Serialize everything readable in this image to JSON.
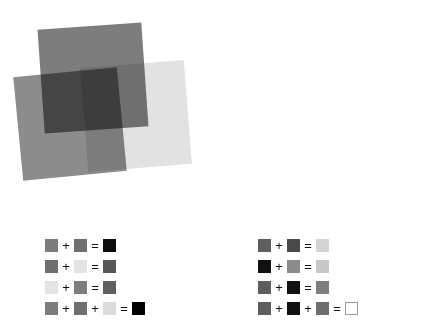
{
  "figure": {
    "background_color": "#ffffff",
    "panels": [
      {
        "name": "multiply-panel",
        "blend_mode": "multiply",
        "squares": [
          {
            "name": "square-top",
            "color": "#7d7d7d",
            "rotation_deg": -4.0
          },
          {
            "name": "square-bottom-left",
            "color": "#8c8c8c",
            "rotation_deg": -5.5
          },
          {
            "name": "square-bottom-right",
            "color": "#e2e2e2",
            "rotation_deg": -4.5
          }
        ]
      },
      {
        "name": "screen-panel",
        "blend_mode": "screen",
        "squares": [
          {
            "name": "square-top",
            "color": "#8f8f8f",
            "rotation_deg": -4.0
          },
          {
            "name": "square-bottom-left",
            "color": "#666666",
            "rotation_deg": -5.5
          },
          {
            "name": "square-bottom-right",
            "color": "#1f1f1f",
            "rotation_deg": -4.5
          }
        ]
      }
    ]
  },
  "chart_data": {
    "type": "table",
    "legends": [
      {
        "name": "multiply-legend",
        "rows": [
          {
            "operands": [
              "#7d7d7d",
              "#6f6f6f"
            ],
            "operators": [
              "+"
            ],
            "equals": "=",
            "result": "#0d0d0d",
            "result_outlined": false
          },
          {
            "operands": [
              "#6f6f6f",
              "#e4e4e4"
            ],
            "operators": [
              "+"
            ],
            "equals": "=",
            "result": "#575757",
            "result_outlined": false
          },
          {
            "operands": [
              "#e4e4e4",
              "#7d7d7d"
            ],
            "operators": [
              "+"
            ],
            "equals": "=",
            "result": "#5f5f5f",
            "result_outlined": false
          },
          {
            "operands": [
              "#7d7d7d",
              "#6f6f6f",
              "#dcdcdc"
            ],
            "operators": [
              "+",
              "+"
            ],
            "equals": "=",
            "result": "#000000",
            "result_outlined": false
          }
        ]
      },
      {
        "name": "screen-legend",
        "rows": [
          {
            "operands": [
              "#5e5e5e",
              "#4a4a4a"
            ],
            "operators": [
              "+"
            ],
            "equals": "=",
            "result": "#d4d4d4",
            "result_outlined": false
          },
          {
            "operands": [
              "#111111",
              "#8b8b8b"
            ],
            "operators": [
              "+"
            ],
            "equals": "=",
            "result": "#c8c8c8",
            "result_outlined": false
          },
          {
            "operands": [
              "#5e5e5e",
              "#111111"
            ],
            "operators": [
              "+"
            ],
            "equals": "=",
            "result": "#7d7d7d",
            "result_outlined": false
          },
          {
            "operands": [
              "#5e5e5e",
              "#111111",
              "#6e6e6e"
            ],
            "operators": [
              "+",
              "+"
            ],
            "equals": "=",
            "result": "#ffffff",
            "result_outlined": true
          }
        ]
      }
    ]
  }
}
